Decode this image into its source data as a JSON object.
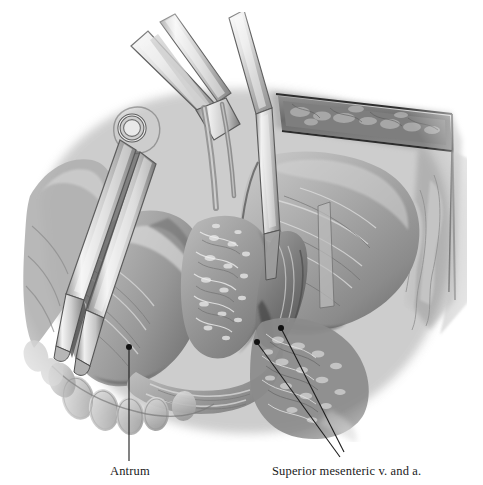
{
  "plate": {
    "letter": "R",
    "top_caption_fragment": "g                     g    p"
  },
  "illustration": {
    "title": "Surgical exposure of the pancreatic head and duodenum",
    "medium": "grayscale anatomical wash drawing",
    "palette": {
      "background": "#ffffff",
      "tissue_light": "#d8d8d8",
      "tissue_mid": "#a8a8a8",
      "tissue_dark": "#6f6f6f",
      "tissue_shadow": "#4a4a4a",
      "instrument_steel": "#e6e6e6",
      "instrument_edge": "#7a7a7a",
      "outline": "#2b2b2b",
      "label_ink": "#1a1a1a",
      "dot": "#111111"
    },
    "structures": [
      "surgical clamp (Kocher forceps) with hinge pivot",
      "second clamp shaft crossing the field",
      "retracted abdominal wall with subcutaneous fat layer",
      "liver / right upper quadrant mass",
      "gastric antrum",
      "pancreatic head with lobulated surface",
      "duodenum",
      "omental and mesenteric fat",
      "superior mesenteric vessels"
    ]
  },
  "annotations": [
    {
      "id": "antrum",
      "label": "Antrum",
      "dots": [
        {
          "x": 129,
          "y": 347
        }
      ],
      "leader": {
        "type": "vertical",
        "from": {
          "x": 129,
          "y": 350
        },
        "to": {
          "x": 129,
          "y": 461
        }
      }
    },
    {
      "id": "superior-mesenteric",
      "label": "Superior mesenteric v. and a.",
      "dots": [
        {
          "x": 257,
          "y": 342
        },
        {
          "x": 281,
          "y": 328
        }
      ],
      "leader": {
        "type": "diagonal-pair",
        "to": {
          "x": 340,
          "y": 457
        }
      }
    }
  ]
}
